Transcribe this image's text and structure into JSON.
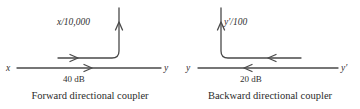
{
  "figure": {
    "background_color": "#ffffff",
    "line_color": "#4a4a4a",
    "text_color": "#2b2b2b"
  },
  "panels": [
    {
      "id": "forward",
      "caption": "Forward directional coupler",
      "input_label": "x",
      "output_label": "y",
      "branch_label": "x/10,000",
      "coupling_label": "40 dB",
      "flow_direction": "left-to-right",
      "branch_direction": "up"
    },
    {
      "id": "backward",
      "caption": "Backward directional coupler",
      "input_label": "y′",
      "output_label": "y",
      "branch_label": "y′/100",
      "coupling_label": "20 dB",
      "flow_direction": "right-to-left",
      "branch_direction": "up"
    }
  ]
}
